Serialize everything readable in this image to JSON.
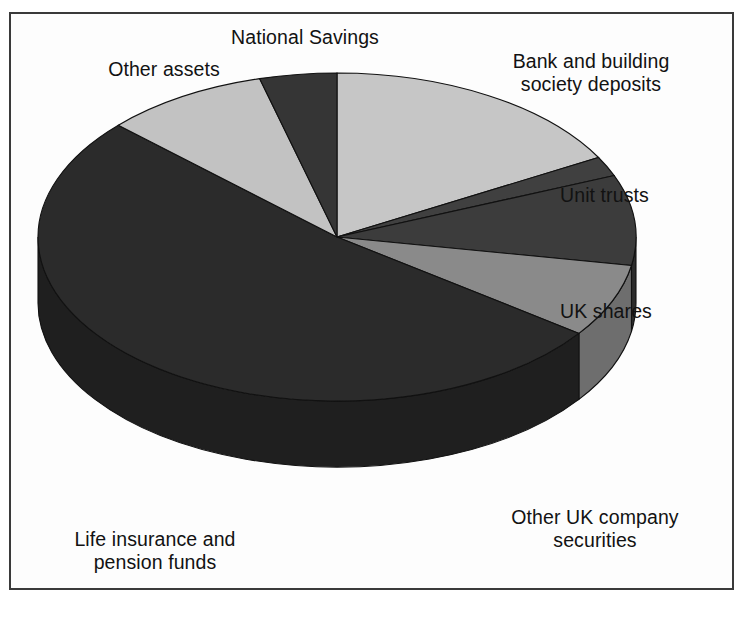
{
  "figure": {
    "top_cut_text": "",
    "background": "#ffffff",
    "frame_border_color": "#3a3a3a"
  },
  "labels": {
    "national_savings": "National Savings",
    "other_assets": "Other assets",
    "bank_deposits": "Bank and building\nsociety deposits",
    "unit_trusts": "Unit trusts",
    "uk_shares": "UK shares",
    "other_uk_securities": "Other UK company\nsecurities",
    "life_pension": "Life insurance and\npension funds"
  },
  "chart_data": {
    "type": "pie",
    "title": "",
    "subtitle": "",
    "xlabel": "",
    "ylabel": "",
    "style": "3d-pie",
    "legend_position": "outside-callout-labels",
    "grid": false,
    "start_angle_deg": 0,
    "direction": "clockwise",
    "center_px": [
      337,
      237
    ],
    "radius_x_px": 299,
    "radius_y_px": 164,
    "depth_px": 66,
    "categories": [
      "Bank and building society deposits",
      "Unit trusts",
      "UK shares",
      "Other UK company securities",
      "Life insurance and pension funds",
      "Other assets",
      "National Savings"
    ],
    "values": [
      17,
      2,
      9,
      7,
      52,
      9,
      4
    ],
    "value_unit": "percent",
    "slices": [
      {
        "label": "Bank and building society deposits",
        "value": 17,
        "start_deg": 0,
        "end_deg": 61,
        "color": "#c6c6c6",
        "side_color": "#a8a8a8"
      },
      {
        "label": "Unit trusts",
        "value": 2,
        "start_deg": 61,
        "end_deg": 68,
        "color": "#404040",
        "side_color": "#303030"
      },
      {
        "label": "UK shares",
        "value": 9,
        "start_deg": 68,
        "end_deg": 100,
        "color": "#3c3c3c",
        "side_color": "#2c2c2c"
      },
      {
        "label": "Other UK company securities",
        "value": 7,
        "start_deg": 100,
        "end_deg": 126,
        "color": "#8a8a8a",
        "side_color": "#6e6e6e"
      },
      {
        "label": "Life insurance and pension funds",
        "value": 52,
        "start_deg": 126,
        "end_deg": 313,
        "color": "#2b2b2b",
        "side_color": "#1f1f1f"
      },
      {
        "label": "Other assets",
        "value": 9,
        "start_deg": 313,
        "end_deg": 345,
        "color": "#c2c2c2",
        "side_color": "#a4a4a4"
      },
      {
        "label": "National Savings",
        "value": 4,
        "start_deg": 345,
        "end_deg": 360,
        "color": "#353535",
        "side_color": "#262626"
      }
    ]
  }
}
